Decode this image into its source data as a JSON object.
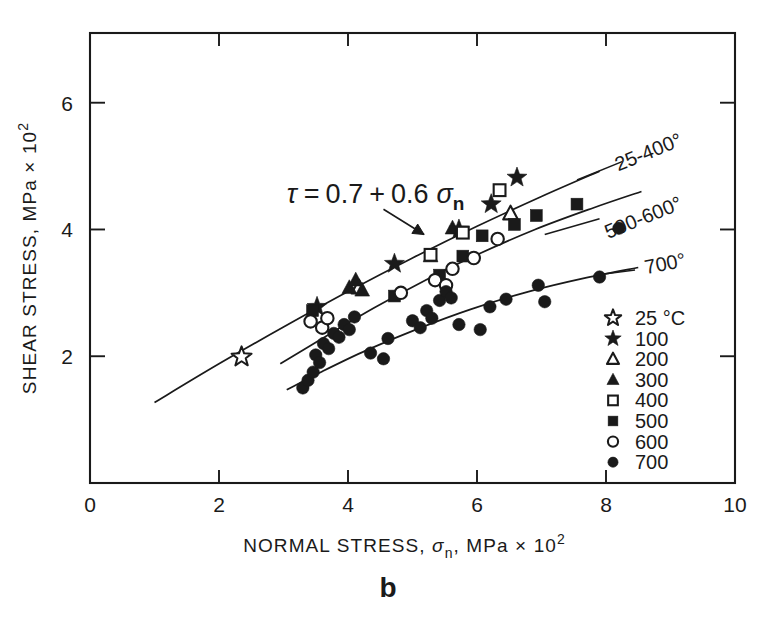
{
  "figure": {
    "panel_label": "b",
    "background": "#ffffff",
    "ink": "#1a1a1a"
  },
  "chart_data": {
    "type": "scatter",
    "title": "",
    "xlabel": "NORMAL STRESS, σn , MPa × 10²",
    "ylabel": "SHEAR STRESS, MPa × 10²",
    "xlabel_parts": {
      "lead": "NORMAL STRESS,",
      "sym": "σ",
      "sub": "n",
      "tail": ", MPa",
      "times": "×",
      "base": "10",
      "exp": "2"
    },
    "ylabel_parts": {
      "lead": "SHEAR STRESS, MPa",
      "times": "×",
      "base": "10",
      "exp": "2"
    },
    "xlim": [
      0,
      10
    ],
    "ylim": [
      0,
      7.1
    ],
    "xticks": [
      0,
      2,
      4,
      6,
      8,
      10
    ],
    "xticklabels": [
      "0",
      "2",
      "4",
      "6",
      "8",
      "10"
    ],
    "yticks": [
      2,
      4,
      6
    ],
    "yticklabels": [
      "2",
      "4",
      "6"
    ],
    "grid": false,
    "legend_position": "lower-right inside axes",
    "annotations": [
      {
        "name": "friction-equation",
        "text": "τ = 0.7 + 0.6 σn",
        "x": 3.05,
        "y": 4.42,
        "parts": {
          "tau": "τ",
          "eq": "=",
          "a": "0.7",
          "plus": "+",
          "b": "0.6",
          "sym": "σ",
          "sub": "n"
        },
        "leader_from": [
          4.55,
          4.32
        ],
        "leader_to": [
          5.18,
          3.92
        ]
      },
      {
        "name": "curve-label-25-400",
        "text": "25-400°",
        "x": 9.2,
        "y": 5.33,
        "rotation": -22
      },
      {
        "name": "curve-label-500-600",
        "text": "500-600°",
        "x": 9.2,
        "y": 4.33,
        "rotation": -22
      },
      {
        "name": "curve-label-700",
        "text": "700°",
        "x": 9.25,
        "y": 3.42,
        "rotation": -11
      }
    ],
    "curves": [
      {
        "name": "curve-25-400",
        "label": "25-400°",
        "points": [
          [
            1.0,
            1.27
          ],
          [
            2.0,
            1.88
          ],
          [
            3.0,
            2.46
          ],
          [
            4.0,
            3.02
          ],
          [
            5.0,
            3.55
          ],
          [
            6.0,
            4.05
          ],
          [
            7.0,
            4.52
          ],
          [
            7.9,
            4.92
          ]
        ]
      },
      {
        "name": "curve-500-600",
        "label": "500-600°",
        "points": [
          [
            2.95,
            1.88
          ],
          [
            3.6,
            2.28
          ],
          [
            4.4,
            2.76
          ],
          [
            5.2,
            3.2
          ],
          [
            6.0,
            3.6
          ],
          [
            6.9,
            4.0
          ],
          [
            7.8,
            4.34
          ],
          [
            8.55,
            4.6
          ]
        ]
      },
      {
        "name": "curve-700",
        "label": "700°",
        "points": [
          [
            3.05,
            1.47
          ],
          [
            3.6,
            1.76
          ],
          [
            4.3,
            2.1
          ],
          [
            5.1,
            2.44
          ],
          [
            5.9,
            2.74
          ],
          [
            6.8,
            3.02
          ],
          [
            7.7,
            3.24
          ],
          [
            8.5,
            3.4
          ]
        ]
      }
    ],
    "series": [
      {
        "name": "25 °C",
        "label": "25 °C",
        "marker": "star-open",
        "filled": false,
        "points": [
          [
            2.35,
            1.99
          ]
        ]
      },
      {
        "name": "100",
        "label": "100",
        "marker": "star-filled",
        "filled": true,
        "points": [
          [
            3.52,
            2.78
          ],
          [
            4.72,
            3.46
          ],
          [
            5.72,
            4.0
          ],
          [
            6.22,
            4.4
          ],
          [
            6.62,
            4.82
          ]
        ]
      },
      {
        "name": "200",
        "label": "200",
        "marker": "triangle-open",
        "filled": false,
        "points": [
          [
            4.17,
            3.08
          ],
          [
            6.52,
            4.25
          ]
        ]
      },
      {
        "name": "300",
        "label": "300",
        "marker": "triangle-filled",
        "filled": true,
        "points": [
          [
            4.02,
            3.08
          ],
          [
            4.12,
            3.2
          ],
          [
            4.22,
            3.04
          ],
          [
            5.28,
            3.58
          ],
          [
            5.62,
            4.02
          ]
        ]
      },
      {
        "name": "400",
        "label": "400",
        "marker": "square-open",
        "filled": false,
        "points": [
          [
            5.28,
            3.6
          ],
          [
            5.78,
            3.95
          ],
          [
            6.35,
            4.62
          ]
        ]
      },
      {
        "name": "500",
        "label": "500",
        "marker": "square-filled",
        "filled": true,
        "points": [
          [
            3.45,
            2.72
          ],
          [
            4.72,
            2.95
          ],
          [
            5.42,
            3.28
          ],
          [
            5.78,
            3.58
          ],
          [
            6.08,
            3.9
          ],
          [
            6.58,
            4.08
          ],
          [
            6.92,
            4.22
          ],
          [
            7.55,
            4.4
          ]
        ]
      },
      {
        "name": "600",
        "label": "600",
        "marker": "circle-open",
        "filled": false,
        "points": [
          [
            3.42,
            2.55
          ],
          [
            3.6,
            2.45
          ],
          [
            3.68,
            2.6
          ],
          [
            4.82,
            3.0
          ],
          [
            5.35,
            3.2
          ],
          [
            5.52,
            3.12
          ],
          [
            5.62,
            3.38
          ],
          [
            5.95,
            3.55
          ],
          [
            6.32,
            3.85
          ]
        ]
      },
      {
        "name": "700",
        "label": "700",
        "marker": "circle-filled",
        "filled": true,
        "points": [
          [
            3.3,
            1.5
          ],
          [
            3.38,
            1.62
          ],
          [
            3.46,
            1.75
          ],
          [
            3.5,
            2.02
          ],
          [
            3.56,
            1.9
          ],
          [
            3.62,
            2.2
          ],
          [
            3.7,
            2.12
          ],
          [
            3.78,
            2.36
          ],
          [
            3.86,
            2.3
          ],
          [
            3.94,
            2.5
          ],
          [
            4.02,
            2.42
          ],
          [
            4.1,
            2.62
          ],
          [
            4.35,
            2.05
          ],
          [
            4.55,
            1.96
          ],
          [
            4.62,
            2.28
          ],
          [
            5.0,
            2.56
          ],
          [
            5.12,
            2.45
          ],
          [
            5.22,
            2.72
          ],
          [
            5.3,
            2.6
          ],
          [
            5.42,
            2.88
          ],
          [
            5.52,
            3.02
          ],
          [
            5.6,
            2.92
          ],
          [
            5.72,
            2.5
          ],
          [
            6.05,
            2.42
          ],
          [
            6.2,
            2.78
          ],
          [
            6.45,
            2.9
          ],
          [
            6.95,
            3.12
          ],
          [
            7.05,
            2.86
          ],
          [
            7.9,
            3.25
          ],
          [
            8.2,
            4.02
          ]
        ]
      }
    ]
  },
  "legend": {
    "name": "temperature-legend",
    "entries": [
      {
        "marker": "star-open",
        "label": "25 °C"
      },
      {
        "marker": "star-filled",
        "label": "100"
      },
      {
        "marker": "triangle-open",
        "label": "200"
      },
      {
        "marker": "triangle-filled",
        "label": "300"
      },
      {
        "marker": "square-open",
        "label": "400"
      },
      {
        "marker": "square-filled",
        "label": "500"
      },
      {
        "marker": "circle-open",
        "label": "600"
      },
      {
        "marker": "circle-filled",
        "label": "700"
      }
    ]
  }
}
